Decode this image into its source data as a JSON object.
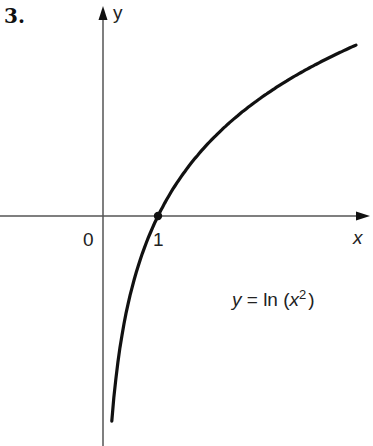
{
  "problem_number": "3.",
  "chart_data": {
    "type": "line",
    "title": "",
    "equation_label": "y = ln (x²)",
    "equation": {
      "lhs": "y",
      "eq": " = ln (",
      "var": "x",
      "sup": "2",
      "close": ")"
    },
    "xlabel": "x",
    "ylabel": "y",
    "origin_label": "0",
    "x_tick_labels": [
      "1"
    ],
    "marked_point": {
      "x": 1,
      "y": 0
    },
    "series": [
      {
        "name": "y = ln(x^2)",
        "x": [
          0.16,
          0.25,
          0.5,
          1,
          1.5,
          2,
          3,
          4,
          4.6
        ],
        "y": [
          -3.67,
          -2.77,
          -1.39,
          0,
          0.81,
          1.39,
          2.2,
          2.77,
          3.05
        ]
      }
    ],
    "xlim": [
      -1.9,
      4.8
    ],
    "ylim": [
      -4.1,
      3.8
    ],
    "grid": false,
    "legend": "none"
  }
}
